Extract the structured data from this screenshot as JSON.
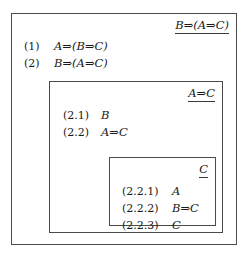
{
  "diagram": {
    "type": "nested-proof-boxes"
  },
  "outer_box": {
    "goal": "B⇒(A⇒C)",
    "lines": [
      {
        "number": "(1)",
        "formula": "A⇒(B⇒C)"
      },
      {
        "number": "(2)",
        "formula": "B⇒(A⇒C)"
      }
    ]
  },
  "middle_box": {
    "goal": "A⇒C",
    "lines": [
      {
        "number": "(2.1)",
        "formula": "B"
      },
      {
        "number": "(2.2)",
        "formula": "A⇒C"
      }
    ]
  },
  "inner_box": {
    "goal": "C",
    "lines": [
      {
        "number": "(2.2.1)",
        "formula": "A"
      },
      {
        "number": "(2.2.2)",
        "formula": "B⇒C"
      },
      {
        "number": "(2.2.3)",
        "formula": "C"
      }
    ]
  },
  "colors": {
    "background": "#ffffff",
    "border": "#4a4a4a",
    "text": "#1a1a1a",
    "underline": "#3a3a3a"
  }
}
